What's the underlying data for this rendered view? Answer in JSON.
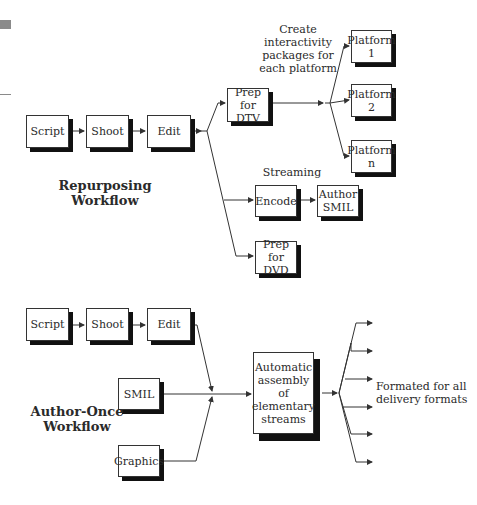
{
  "repurposing": {
    "title": "Repurposing\nWorkflow",
    "boxes": {
      "script": "Script",
      "shoot": "Shoot",
      "edit": "Edit",
      "prep_dtv": "Prep for\nDTV",
      "platform_1": "Platform\n1",
      "platform_2": "Platform\n2",
      "platform_n": "Platform\nn",
      "encode": "Encode",
      "author_smil": "Author\nSMIL",
      "prep_dvd": "Prep for\nDVD"
    },
    "annotations": {
      "interactivity": "Create interactivity\npackages for\neach platform",
      "streaming": "Streaming"
    }
  },
  "author_once": {
    "title": "Author-Once\nWorkflow",
    "boxes": {
      "script": "Script",
      "shoot": "Shoot",
      "edit": "Edit",
      "smil": "SMIL",
      "graphics": "Graphics",
      "assembly": "Automatic\nassembly of\nelementary\nstreams"
    },
    "annotations": {
      "output": "Formated for all\ndelivery formats"
    },
    "output_arrow_count": 6
  },
  "colors": {
    "line": "#333333",
    "shadow": "#111111",
    "margin_mark": "#8a8a8a"
  }
}
